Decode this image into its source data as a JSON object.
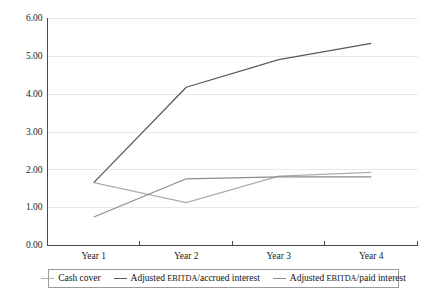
{
  "chart_data": {
    "type": "line",
    "title": "",
    "xlabel": "",
    "ylabel": "",
    "categories": [
      "Year 1",
      "Year 2",
      "Year 3",
      "Year 4"
    ],
    "ylim": [
      0,
      6
    ],
    "ytick_labels": [
      "0.00",
      "1.00",
      "2.00",
      "3.00",
      "4.00",
      "5.00",
      "6.00"
    ],
    "ytick_values": [
      0,
      1,
      2,
      3,
      4,
      5,
      6
    ],
    "grid": true,
    "legend_position": "bottom",
    "series": [
      {
        "name": "Cash cover",
        "color": "#adadad",
        "values": [
          1.65,
          1.12,
          1.82,
          1.92
        ]
      },
      {
        "name": "Adjusted EBITDA/accrued interest",
        "name_prefix": "Adjusted ",
        "name_smallcaps": "EBITDA",
        "name_suffix": "/accrued interest",
        "color": "#585858",
        "values": [
          1.65,
          4.17,
          4.9,
          5.33
        ]
      },
      {
        "name": "Adjusted EBITDA/paid interest",
        "name_prefix": "Adjusted ",
        "name_smallcaps": "EBITDA",
        "name_suffix": "/paid interest",
        "color": "#8c8c8c",
        "values": [
          0.74,
          1.75,
          1.8,
          1.8
        ]
      }
    ]
  },
  "axis": {
    "y_labels": [
      "6.00",
      "5.00",
      "4.00",
      "3.00",
      "2.00",
      "1.00",
      "0.00"
    ],
    "x_labels": [
      "Year 1",
      "Year 2",
      "Year 3",
      "Year 4"
    ]
  },
  "colors": {
    "gridline": "#e3e3e3",
    "axis": "#4a4a4a",
    "legend_border": "#9a9a9a",
    "text": "#1a1a1a",
    "background": "#ffffff"
  }
}
